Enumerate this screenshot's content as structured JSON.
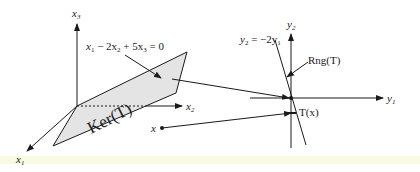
{
  "diagram": {
    "left_space": {
      "axes": {
        "x1_label": "x",
        "x1_sub": "1",
        "x2_label": "x",
        "x2_sub": "2",
        "x3_label": "x",
        "x3_sub": "3"
      },
      "plane_label": "Ker(T)",
      "equation": {
        "t1": "x",
        "s1": "1",
        "t2": " − 2x",
        "s2": "2",
        "t3": " + 5x",
        "s3": "3",
        "t4": " = 0"
      },
      "point_label": "x"
    },
    "right_space": {
      "axes": {
        "y1_label": "y",
        "y1_sub": "1",
        "y2_label": "y",
        "y2_sub": "2"
      },
      "line_equation": {
        "t1": "y",
        "s1": "2",
        "t2": " = −2y",
        "s2": "1"
      },
      "range_label": "Rng(T)",
      "image_label": "T(x)"
    },
    "colors": {
      "ink": "#1a1a1a",
      "plane_fill": "#e4e4e4",
      "background": "#ffffff",
      "band": "#f8fbe2"
    }
  }
}
